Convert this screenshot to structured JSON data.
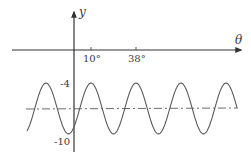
{
  "chart_data": {
    "type": "line",
    "title": "",
    "xlabel": "θ",
    "ylabel": "y",
    "x_unit": "degrees",
    "x_ticks": [
      {
        "value": 10,
        "label": "10°"
      },
      {
        "value": 38,
        "label": "38°"
      }
    ],
    "y_ticks": [
      {
        "value": -4,
        "label": "-4"
      },
      {
        "value": -10,
        "label": "-10"
      }
    ],
    "series": [
      {
        "name": "y = 3 cos(θ' ) - 7 (sinusoid)",
        "style": "solid",
        "max": -4,
        "min": -10,
        "midline": -7,
        "period_deg": 28,
        "first_max_at_deg": 10,
        "x": [
          -18,
          -4,
          10,
          24,
          38,
          52,
          66,
          80,
          94
        ],
        "y": [
          -4,
          -10,
          -4,
          -10,
          -4,
          -10,
          -4,
          -10,
          -4
        ]
      },
      {
        "name": "midline",
        "style": "dash-dot",
        "y_value": -7
      }
    ],
    "grid": false,
    "legend": null
  },
  "labels": {
    "x_axis": "θ",
    "y_axis": "y",
    "tick_10": "10°",
    "tick_38": "38°",
    "tick_neg4": "-4",
    "tick_neg10": "-10"
  },
  "colors": {
    "axis": "#333333",
    "curve": "#5a5a5a",
    "midline": "#5a5a5a"
  }
}
